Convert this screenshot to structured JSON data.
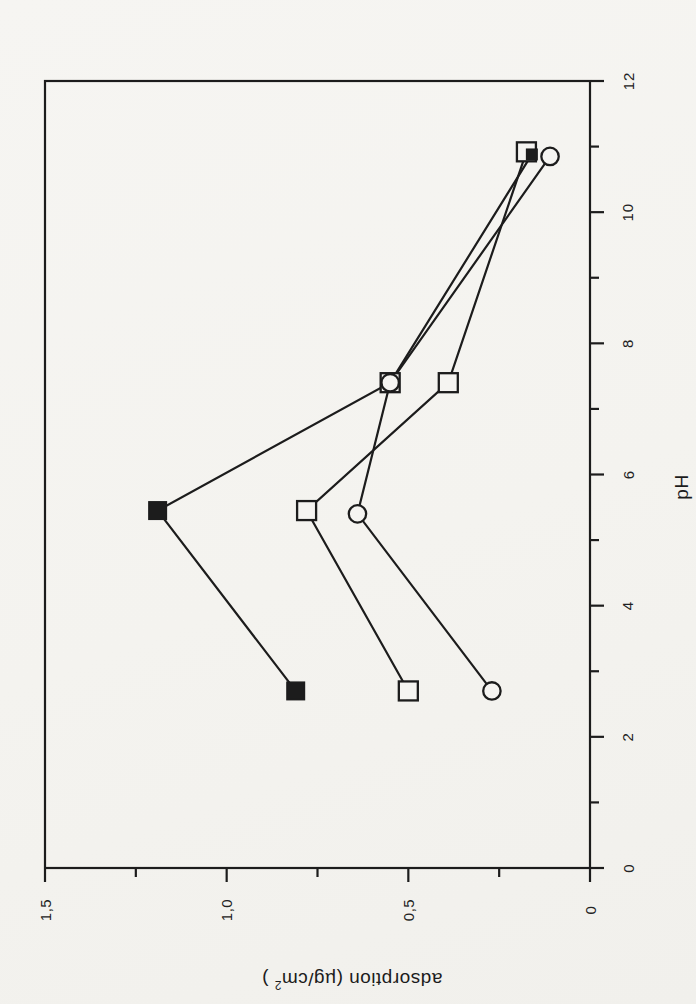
{
  "figure": {
    "background": "#f5f4f1",
    "ink": "#1c1c1c"
  },
  "chart_data": {
    "type": "line",
    "title": "",
    "xlabel": "pH",
    "ylabel": "adsorption (µg/cm2 )",
    "ylabel_parts": {
      "prefix": "adsorption (µg/cm",
      "superscript": "2",
      "suffix": " )"
    },
    "grid": false,
    "legend": "none",
    "x_axis": {
      "label": "pH",
      "min": 0,
      "max": 12,
      "major_step": 2,
      "minor_step": 1,
      "tick_labels": [
        "0",
        "2",
        "4",
        "6",
        "8",
        "10",
        "12"
      ]
    },
    "y_axis": {
      "label": "adsorption (µg/cm2 )",
      "min": 0,
      "max": 1.5,
      "major_step": 0.5,
      "minor_step": 0.25,
      "tick_labels": [
        "0",
        "0,5",
        "1,0",
        "1,5"
      ]
    },
    "series": [
      {
        "name": "filled squares",
        "marker": "filled-square",
        "points": [
          [
            2.7,
            0.81
          ],
          [
            5.45,
            1.19
          ],
          [
            7.4,
            0.55
          ],
          [
            10.88,
            0.16
          ]
        ],
        "point_marker_overrides": {
          "2": "open-square",
          "3": "small-filled-square"
        }
      },
      {
        "name": "open squares",
        "marker": "open-square",
        "points": [
          [
            2.7,
            0.5
          ],
          [
            5.45,
            0.78
          ],
          [
            7.4,
            0.39
          ],
          [
            10.92,
            0.175
          ]
        ]
      },
      {
        "name": "open circles",
        "marker": "open-circle",
        "points": [
          [
            2.7,
            0.27
          ],
          [
            5.4,
            0.64
          ],
          [
            7.4,
            0.55
          ],
          [
            10.85,
            0.11
          ]
        ]
      }
    ]
  }
}
